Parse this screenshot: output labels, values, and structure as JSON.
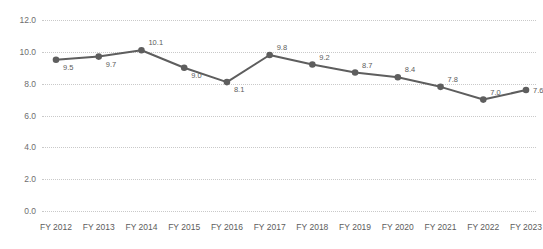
{
  "chart_data": {
    "type": "line",
    "title": "",
    "xlabel": "",
    "ylabel": "",
    "categories": [
      "FY 2012",
      "FY 2013",
      "FY 2014",
      "FY 2015",
      "FY 2016",
      "FY 2017",
      "FY 2018",
      "FY 2019",
      "FY 2020",
      "FY 2021",
      "FY 2022",
      "FY 2023"
    ],
    "values": [
      9.5,
      9.7,
      10.1,
      9.0,
      8.1,
      9.8,
      9.2,
      8.7,
      8.4,
      7.8,
      7.0,
      7.6
    ],
    "point_labels": [
      "9.5",
      "9.7",
      "10.1",
      "9.0",
      "8.1",
      "9.8",
      "9.2",
      "8.7",
      "8.4",
      "7.8",
      "7.0",
      "7.6"
    ],
    "label_positions": [
      "below-right",
      "below-right",
      "above-right",
      "below-right",
      "below-right",
      "above-right",
      "above-right",
      "above-right",
      "above-right",
      "above-right",
      "above-right",
      "right"
    ],
    "ylim": [
      0.0,
      12.0
    ],
    "yticks": [
      0.0,
      2.0,
      4.0,
      6.0,
      8.0,
      10.0,
      12.0
    ],
    "ytick_labels": [
      "0.0",
      "2.0",
      "4.0",
      "6.0",
      "8.0",
      "10.0",
      "12.0"
    ],
    "grid": true,
    "grid_style": "dotted",
    "legend": "none",
    "series_color": "#5e5e5e",
    "grid_color": "#c9c9c9",
    "tick_label_color": "#6e6e6e",
    "data_label_color": "#5c5c5c",
    "background_color": "#ffffff"
  }
}
